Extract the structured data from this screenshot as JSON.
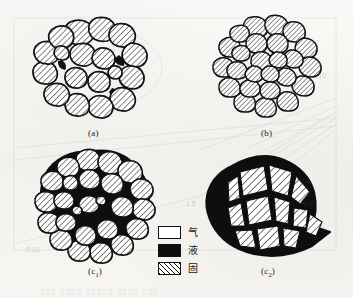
{
  "figure": {
    "type": "scientific-illustration",
    "background_color": "#f7f5f2",
    "ink_color": "#111111",
    "panels": [
      {
        "id": "a",
        "caption": "(a)",
        "description": "loosely packed rounded solid particles with small liquid pockets and white gas voids",
        "phases_present": [
          "solid",
          "liquid",
          "gas"
        ]
      },
      {
        "id": "b",
        "caption": "(b)",
        "description": "densely packed rounded solid particles with thin white gas gaps",
        "phases_present": [
          "solid",
          "gas"
        ]
      },
      {
        "id": "c1",
        "caption": "(c",
        "caption_sub": "1",
        "caption_close": ")",
        "description": "solid particles with liquid filling all interstitial space",
        "phases_present": [
          "solid",
          "liquid"
        ]
      },
      {
        "id": "c2",
        "caption": "(c",
        "caption_sub": "2",
        "caption_close": ")",
        "description": "consolidated angular polygonal grains separated by thick liquid boundaries",
        "phases_present": [
          "solid",
          "liquid"
        ]
      }
    ],
    "legend": {
      "items": [
        {
          "key": "gas",
          "label": "气",
          "swatch": "white-outlined",
          "color": "#ffffff"
        },
        {
          "key": "liquid",
          "label": "液",
          "swatch": "solid-black",
          "color": "#0d0d0d"
        },
        {
          "key": "solid",
          "label": "固",
          "swatch": "diagonal-hatch",
          "color": "#111111"
        }
      ]
    },
    "bleed_through": {
      "note": "faint text and lines showing through from reverse page",
      "marks": [
        {
          "text": "0.10",
          "x": 26,
          "y": 246
        },
        {
          "text": "+0.4",
          "x": 296,
          "y": 178
        },
        {
          "text": "+0.2",
          "x": 300,
          "y": 200
        },
        {
          "text": "10",
          "x": 318,
          "y": 72
        },
        {
          "text": "1.5",
          "x": 186,
          "y": 200
        }
      ]
    }
  }
}
